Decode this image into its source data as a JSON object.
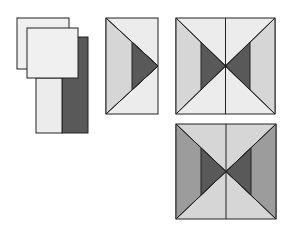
{
  "diagram": {
    "colors": {
      "background": "#ffffff",
      "light": "#ececec",
      "medium_light": "#d6d6d6",
      "medium": "#9c9c9c",
      "dark": "#595959",
      "stroke": "#222222"
    },
    "steps": [
      {
        "id": "step-1",
        "label": "Stacked squares over strip pair"
      },
      {
        "id": "step-2",
        "label": "Flying geese unit"
      },
      {
        "id": "step-3",
        "label": "Hourglass block (light)"
      },
      {
        "id": "step-4",
        "label": "Hourglass block (medium sides)"
      }
    ]
  }
}
